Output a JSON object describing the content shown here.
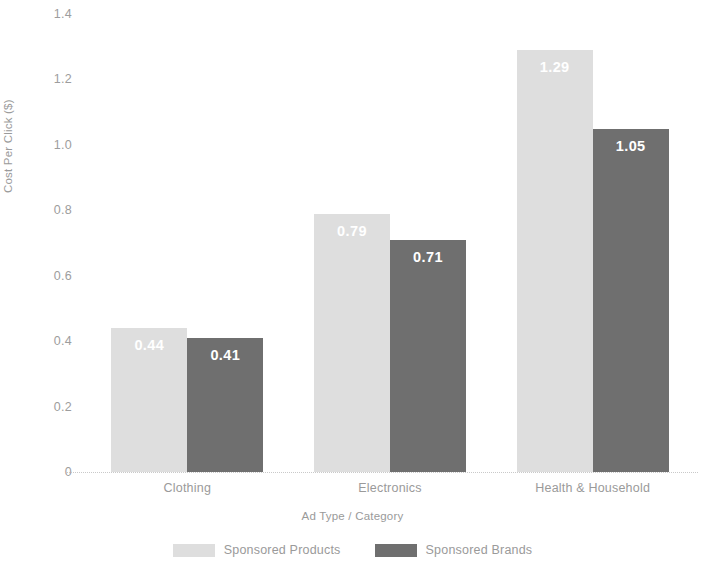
{
  "chart_data": {
    "type": "bar",
    "title": "",
    "subtitle": "",
    "xlabel": "Ad Type / Category",
    "ylabel": "Cost Per Click ($)",
    "categories": [
      "Clothing",
      "Electronics",
      "Health & Household"
    ],
    "series": [
      {
        "name": "Sponsored Products",
        "color": "#dedede",
        "values": [
          0.44,
          0.79,
          1.29
        ],
        "labels": [
          "0.44",
          "0.79",
          "1.29"
        ]
      },
      {
        "name": "Sponsored Brands",
        "color": "#6f6f6f",
        "values": [
          0.41,
          0.71,
          1.05
        ],
        "labels": [
          "0.41",
          "0.71",
          "1.05"
        ]
      }
    ],
    "ylim": [
      0,
      1.4
    ],
    "yticks": [
      0,
      0.2,
      0.4,
      0.6,
      0.8,
      1.0,
      1.2,
      1.4
    ],
    "ytick_labels": [
      "0",
      "0.2",
      "0.4",
      "0.6",
      "0.8",
      "1.0",
      "1.2",
      "1.4"
    ],
    "grid": false,
    "legend_position": "bottom",
    "value_labels_shown": true,
    "value_label_color": "#ffffff",
    "axis_text_color": "#9a9a9a"
  }
}
